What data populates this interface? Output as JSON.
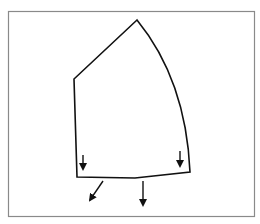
{
  "diagram": {
    "type": "shape-with-force-arrows",
    "frame": {
      "x": 8,
      "y": 11,
      "width": 247,
      "height": 206,
      "stroke": "#8a8a8a"
    },
    "shape": {
      "stroke": "#111111",
      "vertices": {
        "top": [
          137,
          20
        ],
        "left": [
          74,
          79
        ],
        "bottom_left": [
          77,
          177
        ],
        "bottom_mid": [
          135,
          178
        ],
        "bottom_right": [
          190,
          172
        ]
      },
      "right_edge": "curved arc from top to bottom_right",
      "bottom_edge": "slight bend at bottom_mid"
    },
    "arrows": [
      {
        "name": "inner-left-down",
        "from": [
          83,
          155
        ],
        "to": [
          83,
          170
        ]
      },
      {
        "name": "inner-right-down",
        "from": [
          180,
          151
        ],
        "to": [
          180,
          167
        ]
      },
      {
        "name": "outer-diagonal",
        "from": [
          103,
          181
        ],
        "to": [
          89,
          202
        ]
      },
      {
        "name": "outer-vertical",
        "from": [
          143,
          181
        ],
        "to": [
          143,
          207
        ]
      }
    ]
  }
}
